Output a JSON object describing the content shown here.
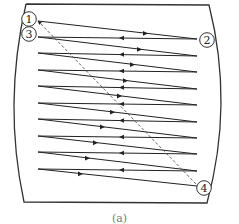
{
  "figure": {
    "caption": "(a)",
    "colors": {
      "line": "#222222",
      "dashed": "#555555",
      "frame": "#333333",
      "background": "#ffffff"
    },
    "frame": {
      "shape": "barrel",
      "top_left": [
        26,
        4
      ],
      "top_right": [
        209,
        5
      ],
      "bottom_right": [
        207,
        203
      ],
      "bottom_left": [
        24,
        202
      ],
      "left_bulge_x": 3,
      "right_bulge_x": 234
    },
    "points": [
      {
        "id": 1,
        "label": "1",
        "x": 29,
        "y": 19,
        "anchor": [
          38,
          21
        ]
      },
      {
        "id": 2,
        "label": "2",
        "x": 207,
        "y": 40,
        "anchor": [
          197,
          39
        ]
      },
      {
        "id": 3,
        "label": "3",
        "x": 29,
        "y": 34,
        "anchor": [
          38,
          37
        ]
      },
      {
        "id": 4,
        "label": "4",
        "x": 204,
        "y": 188,
        "anchor": [
          196,
          186
        ]
      }
    ],
    "path": {
      "left_x": 38,
      "right_x": 197,
      "left_y": [
        21,
        37,
        53,
        70,
        86,
        103,
        119,
        136,
        152,
        169
      ],
      "right_y": [
        39,
        56,
        72,
        89,
        105,
        122,
        138,
        154,
        171,
        186
      ],
      "forward_arrow_x": [
        146,
        140,
        133,
        126,
        120,
        113,
        103,
        96,
        88,
        81
      ],
      "return_arrow_x": 121
    },
    "dashed_return": {
      "from": [
        196,
        184
      ],
      "to": [
        39,
        22
      ],
      "arrow_at": "1"
    }
  }
}
